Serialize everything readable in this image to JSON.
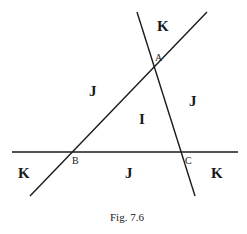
{
  "figure": {
    "caption": "Fig. 7.6",
    "points": {
      "A": "A",
      "B": "B",
      "C": "C"
    },
    "regions": {
      "top_k": "K",
      "left_j": "J",
      "right_j": "J",
      "center_i": "I",
      "bottom_left_k": "K",
      "bottom_j": "J",
      "bottom_right_k": "K"
    },
    "line_color": "#1a1a1a"
  }
}
